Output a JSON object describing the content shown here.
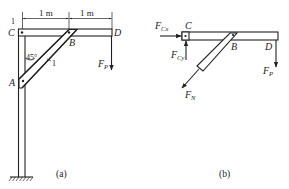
{
  "figure_a": {
    "caption": "(a)",
    "dimensions": [
      {
        "label": "1 m",
        "from": "C",
        "to": "B"
      },
      {
        "label": "1 m",
        "from": "B",
        "to": "D"
      }
    ],
    "points": {
      "C": "C",
      "B": "B",
      "D": "D",
      "A": "A"
    },
    "angle_label": "45°",
    "member_label": "1",
    "corner_label": "1",
    "load": {
      "symbol": "F",
      "subscript": "P"
    }
  },
  "figure_b": {
    "caption": "(b)",
    "points": {
      "C": "C",
      "B": "B",
      "D": "D"
    },
    "forces": [
      {
        "id": "FCx",
        "symbol": "F",
        "subscript": "Cx",
        "direction": "right"
      },
      {
        "id": "FCy",
        "symbol": "F",
        "subscript": "Cy",
        "direction": "up"
      },
      {
        "id": "FN",
        "symbol": "F",
        "subscript": "N",
        "direction": "down-left"
      },
      {
        "id": "FP",
        "symbol": "F",
        "subscript": "P",
        "direction": "down"
      }
    ]
  },
  "colors": {
    "ink": "#222222",
    "background": "#ffffff"
  }
}
